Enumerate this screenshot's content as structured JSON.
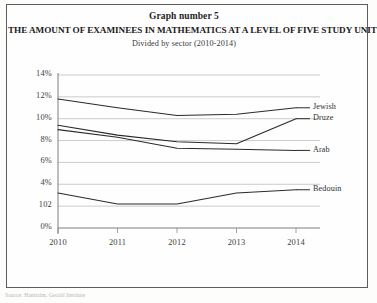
{
  "header": {
    "graph_number": "Graph number 5",
    "title": "THE AMOUNT OF EXAMINEES IN MATHEMATICS AT A LEVEL OF FIVE STUDY UNITS",
    "subtitle": "Divided by sector (2010-2014)"
  },
  "footer": {
    "source": "Source: Hanitzim, Gerald Institute"
  },
  "chart_data": {
    "type": "line",
    "title": "THE AMOUNT OF EXAMINEES IN MATHEMATICS AT A LEVEL OF FIVE STUDY UNITS",
    "subtitle": "Divided by sector (2010-2014)",
    "xlabel": "",
    "ylabel": "",
    "x": [
      "2010",
      "2011",
      "2012",
      "2013",
      "2014"
    ],
    "categories": [
      "2010",
      "2011",
      "2012",
      "2013",
      "2014"
    ],
    "ylim": [
      0,
      14
    ],
    "ytick_labels": [
      "14%",
      "12%",
      "10%",
      "8%",
      "6%",
      "4%",
      "102",
      "0%"
    ],
    "ytick_values": [
      14,
      12,
      10,
      8,
      6,
      4,
      2,
      0
    ],
    "grid": true,
    "legend_position": "right-inline",
    "series": [
      {
        "name": "Jewish",
        "values": [
          11.8,
          11.0,
          10.3,
          10.4,
          11.0
        ]
      },
      {
        "name": "Druze",
        "values": [
          9.4,
          8.5,
          7.9,
          7.7,
          10.0
        ]
      },
      {
        "name": "Arab",
        "values": [
          9.0,
          8.3,
          7.3,
          7.2,
          7.1
        ]
      },
      {
        "name": "Bedouin",
        "values": [
          3.2,
          2.2,
          2.2,
          3.2,
          3.5
        ]
      }
    ]
  }
}
